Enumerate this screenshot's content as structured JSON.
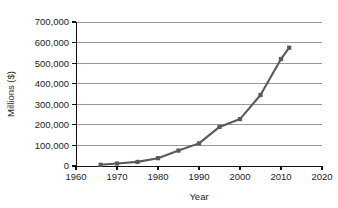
{
  "chart_data": {
    "type": "line",
    "title": "",
    "xlabel": "Year",
    "ylabel": "Millions ($)",
    "xlim": [
      1960,
      2020
    ],
    "ylim": [
      0,
      700000
    ],
    "grid": "horizontal",
    "legend": "none",
    "line_color": "#5a5a5a",
    "marker": "square",
    "x_ticks": [
      "1960",
      "1970",
      "1980",
      "1990",
      "2000",
      "2010",
      "2020"
    ],
    "x_tick_values": [
      1960,
      1970,
      1980,
      1990,
      2000,
      2010,
      2020
    ],
    "y_ticks": [
      "0",
      "100,000",
      "200,000",
      "300,000",
      "400,000",
      "500,000",
      "600,000",
      "700,000"
    ],
    "y_tick_values": [
      0,
      100000,
      200000,
      300000,
      400000,
      500000,
      600000,
      700000
    ],
    "x": [
      1966,
      1970,
      1975,
      1980,
      1985,
      1990,
      1995,
      2000,
      2005,
      2010,
      2012
    ],
    "values": [
      6000,
      12000,
      20000,
      38000,
      75000,
      110000,
      190000,
      228000,
      345000,
      520000,
      575000
    ],
    "series": [
      {
        "name": "",
        "values": [
          6000,
          12000,
          20000,
          38000,
          75000,
          110000,
          190000,
          228000,
          345000,
          520000,
          575000
        ]
      }
    ]
  }
}
